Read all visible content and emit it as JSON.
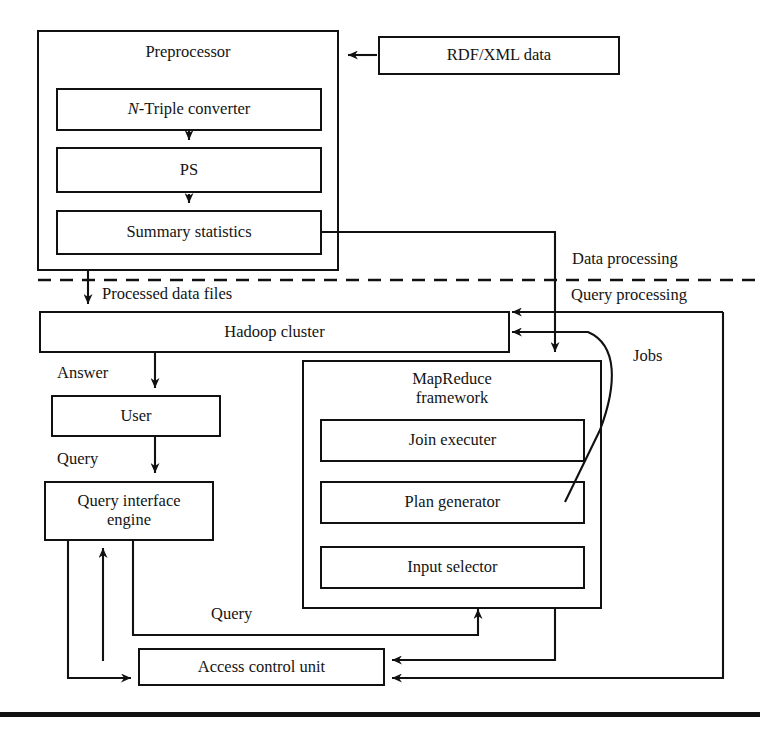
{
  "diagram": {
    "stroke_color": "#111111",
    "background_color": "#ffffff",
    "regions": {
      "data_processing_label": "Data processing",
      "query_processing_label": "Query processing"
    },
    "preprocessor": {
      "title": "Preprocessor",
      "stages": [
        {
          "label": "N-Triple converter",
          "italic_prefix": "N",
          "rest": "-Triple converter"
        },
        {
          "label": "PS"
        },
        {
          "label": "Summary statistics"
        }
      ]
    },
    "input_source": {
      "label": "RDF/XML  data"
    },
    "hadoop": {
      "label": "Hadoop cluster"
    },
    "user": {
      "label": "User"
    },
    "query_interface": {
      "label": "Query interface\nengine",
      "line1": "Query interface",
      "line2": "engine"
    },
    "mapreduce": {
      "title": "MapReduce\nframework",
      "title_line1": "MapReduce",
      "title_line2": "framework",
      "components": [
        {
          "label": "Join executer"
        },
        {
          "label": "Plan generator"
        },
        {
          "label": "Input selector"
        }
      ]
    },
    "access_control": {
      "label": "Access control unit"
    },
    "flow_labels": {
      "processed_data_files": "Processed data files",
      "answer": "Answer",
      "query_user": "Query",
      "jobs": "Jobs",
      "query_access": "Query"
    }
  }
}
